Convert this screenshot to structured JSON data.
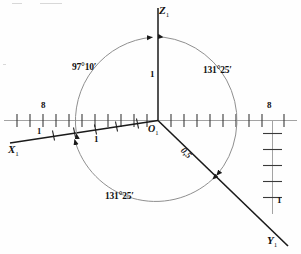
{
  "figure": {
    "kind": "geodetic-axes-angle-diagram",
    "background": "#fefefe",
    "ink": "#1a1a1a",
    "arc_color": "#8a8a8a",
    "axis_color": "#9a9a9a",
    "origin_label": "O",
    "origin_sub": "1",
    "axes": [
      {
        "name": "axis-z",
        "label": "Z",
        "sub": "1",
        "x": 158,
        "y": 12
      },
      {
        "name": "axis-x",
        "label": "X",
        "sub": "1",
        "x": 8,
        "y": 150
      },
      {
        "name": "axis-y",
        "label": "Y",
        "sub": "1",
        "x": 268,
        "y": 239
      }
    ],
    "angles": [
      {
        "name": "angle-x-to-z",
        "value": "97°10′",
        "x": 72,
        "y": 64
      },
      {
        "name": "angle-z-to-y",
        "value": "131°25′",
        "x": 202,
        "y": 68
      },
      {
        "name": "angle-y-to-x",
        "value": "131°25′",
        "x": 104,
        "y": 194
      }
    ],
    "distances": [
      {
        "name": "distance-z",
        "value": "1",
        "x": 150,
        "y": 74
      },
      {
        "name": "distance-x",
        "value": "1",
        "x": 94,
        "y": 141
      },
      {
        "name": "distance-y",
        "value": "0,5",
        "x": 188,
        "y": 152
      }
    ],
    "scalebars": [
      {
        "name": "scalebar-horizontal-left",
        "top_label": "8",
        "bottom_label": "1",
        "top_x": 42,
        "top_y": 105,
        "bottom_x": 38,
        "bottom_y": 126
      },
      {
        "name": "scalebar-horizontal-right",
        "top_label": "8",
        "top_x": 268,
        "top_y": 105
      },
      {
        "name": "scalebar-vertical-right",
        "bottom_label": "1",
        "bottom_x": 275,
        "bottom_y": 200
      }
    ]
  }
}
